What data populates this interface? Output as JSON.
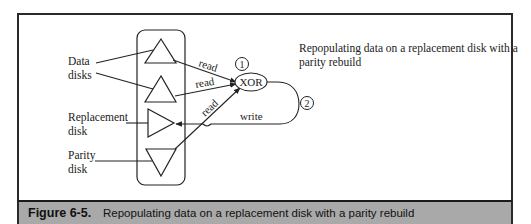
{
  "figure": {
    "label": "Figure 6-5.",
    "caption": "Repopulating data on a replacement disk with a parity rebuild"
  },
  "diagram": {
    "description": "Repopulating data on a replacement disk with a parity rebuild",
    "labels": {
      "data_disks_line1": "Data",
      "data_disks_line2": "disks",
      "replacement_line1": "Replacement",
      "replacement_line2": "disk",
      "parity_line1": "Parity",
      "parity_line2": "disk"
    },
    "operation": "XOR",
    "edges": {
      "read1": "read",
      "read2": "read",
      "read3": "read",
      "write": "write"
    },
    "steps": [
      "1",
      "2"
    ]
  },
  "colors": {
    "line": "#222222",
    "caption_bar": "#a9a9a9"
  }
}
